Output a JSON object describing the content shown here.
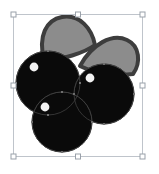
{
  "app": {
    "surface_name": "vector-canvas",
    "background_color": "#ffffff"
  },
  "selection": {
    "label": "Selected object",
    "box": {
      "x": 13,
      "y": 14,
      "width": 129,
      "height": 142
    },
    "stroke_color": "#bfc4cb",
    "handle_fill": "#ffffff",
    "handle_stroke": "#9aa1aa",
    "handle_size": 5,
    "handles": [
      {
        "name": "handle-top-left",
        "x": 13,
        "y": 14,
        "cursor": "nwse-resize"
      },
      {
        "name": "handle-top-center",
        "x": 77.5,
        "y": 14,
        "cursor": "ns-resize"
      },
      {
        "name": "handle-top-right",
        "x": 142,
        "y": 14,
        "cursor": "nesw-resize"
      },
      {
        "name": "handle-middle-left",
        "x": 13,
        "y": 85,
        "cursor": "ew-resize"
      },
      {
        "name": "handle-middle-right",
        "x": 142,
        "y": 85,
        "cursor": "ew-resize"
      },
      {
        "name": "handle-bottom-left",
        "x": 13,
        "y": 156,
        "cursor": "nesw-resize"
      },
      {
        "name": "handle-bottom-center",
        "x": 77.5,
        "y": 156,
        "cursor": "ns-resize"
      },
      {
        "name": "handle-bottom-right",
        "x": 142,
        "y": 156,
        "cursor": "nwse-resize"
      }
    ]
  },
  "artwork": {
    "title": "Berry cluster clipart",
    "colors": {
      "berry_fill": "#0a0a0a",
      "berry_stroke": "#2a2a2a",
      "berry_highlight": "#f2f2f2",
      "leaf_fill": "#8c8c8c",
      "leaf_stroke": "#3d3d3d",
      "path_hint": "#4a4a4a"
    },
    "leaves": [
      {
        "name": "leaf-left",
        "path": "M 44 60 C 38 36 46 20 62 17 C 80 14 92 29 95 45 C 84 53 62 60 44 60 Z",
        "fill": "#8c8c8c",
        "stroke": "#3d3d3d",
        "stroke_width": 4
      },
      {
        "name": "leaf-right",
        "path": "M 80 66 C 92 44 112 33 127 40 C 140 46 141 63 133 74 C 118 76 96 74 80 66 Z",
        "fill": "#8c8c8c",
        "stroke": "#3d3d3d",
        "stroke_width": 4
      }
    ],
    "berries": [
      {
        "name": "berry-left",
        "cx": 48,
        "cy": 83,
        "r": 32,
        "highlight": {
          "cx": 34,
          "cy": 67,
          "r": 4.4
        }
      },
      {
        "name": "berry-right",
        "cx": 104,
        "cy": 94,
        "r": 30,
        "highlight": {
          "cx": 90,
          "cy": 78,
          "r": 4.4
        }
      },
      {
        "name": "berry-bottom",
        "cx": 62,
        "cy": 122,
        "r": 30,
        "highlight": {
          "cx": 45,
          "cy": 107,
          "r": 4.4
        }
      }
    ],
    "anchor_points": [
      {
        "name": "anchor-point",
        "x": 48,
        "y": 51
      },
      {
        "name": "anchor-point",
        "x": 80,
        "y": 83
      },
      {
        "name": "anchor-point",
        "x": 48,
        "y": 115
      },
      {
        "name": "anchor-point",
        "x": 16,
        "y": 83
      },
      {
        "name": "anchor-point",
        "x": 104,
        "y": 64
      },
      {
        "name": "anchor-point",
        "x": 134,
        "y": 94
      },
      {
        "name": "anchor-point",
        "x": 104,
        "y": 124
      },
      {
        "name": "anchor-point",
        "x": 74,
        "y": 94
      },
      {
        "name": "anchor-point",
        "x": 62,
        "y": 92
      },
      {
        "name": "anchor-point",
        "x": 92,
        "y": 122
      },
      {
        "name": "anchor-point",
        "x": 62,
        "y": 152
      },
      {
        "name": "anchor-point",
        "x": 32,
        "y": 122
      }
    ]
  }
}
